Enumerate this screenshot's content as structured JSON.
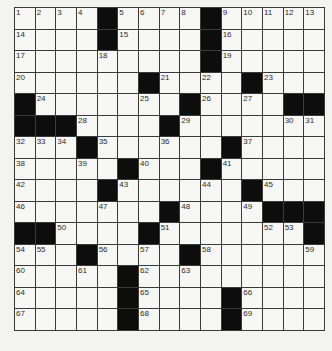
{
  "puzzle": {
    "rows": 15,
    "cols": 15,
    "grid": [
      [
        "1",
        "2",
        "3",
        "4",
        "#",
        "5",
        "6",
        "7",
        "8",
        "#",
        "9",
        "10",
        "11",
        "12",
        "13"
      ],
      [
        "14",
        "",
        "",
        "",
        "#",
        "15",
        "",
        "",
        "",
        "#",
        "16",
        "",
        "",
        "",
        ""
      ],
      [
        "17",
        "",
        "",
        "",
        "18",
        "",
        "",
        "",
        "",
        "#",
        "19",
        "",
        "",
        "",
        ""
      ],
      [
        "20",
        "",
        "",
        "",
        "",
        "",
        "#",
        "21",
        "",
        "22",
        "",
        "#",
        "23",
        "",
        ""
      ],
      [
        "#",
        "24",
        "",
        "",
        "",
        "",
        "25",
        "",
        "#",
        "26",
        "",
        "27",
        "",
        "#",
        "#"
      ],
      [
        "#",
        "#",
        "#",
        "28",
        "",
        "",
        "",
        "#",
        "29",
        "",
        "",
        "",
        "",
        "30",
        "31"
      ],
      [
        "32",
        "33",
        "34",
        "#",
        "35",
        "",
        "",
        "36",
        "",
        "",
        "#",
        "37",
        "",
        "",
        ""
      ],
      [
        "38",
        "",
        "",
        "39",
        "",
        "#",
        "40",
        "",
        "",
        "#",
        "41",
        "",
        "",
        "",
        ""
      ],
      [
        "42",
        "",
        "",
        "",
        "#",
        "43",
        "",
        "",
        "",
        "44",
        "",
        "#",
        "45",
        "",
        ""
      ],
      [
        "46",
        "",
        "",
        "",
        "47",
        "",
        "",
        "#",
        "48",
        "",
        "",
        "49",
        "#",
        "#",
        "#"
      ],
      [
        "#",
        "#",
        "50",
        "",
        "",
        "",
        "#",
        "51",
        "",
        "",
        "",
        "",
        "52",
        "53",
        "#"
      ],
      [
        "54",
        "55",
        "",
        "#",
        "56",
        "",
        "57",
        "",
        "#",
        "58",
        "",
        "",
        "",
        "",
        "59"
      ],
      [
        "60",
        "",
        "",
        "61",
        "",
        "#",
        "62",
        "",
        "63",
        "",
        "",
        "",
        "",
        "",
        ""
      ],
      [
        "64",
        "",
        "",
        "",
        "",
        "#",
        "65",
        "",
        "",
        "",
        "#",
        "66",
        "",
        "",
        ""
      ],
      [
        "67",
        "",
        "",
        "",
        "",
        "#",
        "68",
        "",
        "",
        "",
        "#",
        "69",
        "",
        "",
        ""
      ]
    ]
  },
  "colors": {
    "block": "#0d0d0d",
    "cell": "#f7f7f5",
    "line": "#3a3a3a",
    "background": "#f3f3f1"
  }
}
